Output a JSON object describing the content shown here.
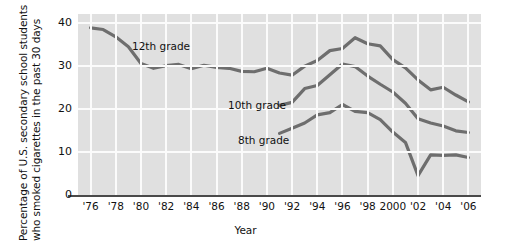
{
  "chart_data": {
    "type": "line",
    "title": "",
    "xlabel": "Year",
    "ylabel": "Percentage of U.S. secondary school students who smoked cigarettes in the past 30 days",
    "ylabel_line1": "Percentage of U.S. secondary school students",
    "ylabel_line2": "who smoked cigarettes in the past 30 days",
    "xlim": [
      1975,
      2007
    ],
    "ylim": [
      0,
      42
    ],
    "yticks": [
      0,
      10,
      20,
      30,
      40
    ],
    "ytick_labels": [
      "0",
      "10",
      "20",
      "30",
      "40"
    ],
    "xticks": [
      1976,
      1978,
      1980,
      1982,
      1984,
      1986,
      1988,
      1990,
      1992,
      1994,
      1996,
      1998,
      2000,
      2002,
      2004,
      2006
    ],
    "xtick_labels": [
      "'76",
      "'78",
      "'80",
      "'82",
      "'84",
      "'86",
      "'88",
      "'90",
      "'92",
      "'94",
      "'96",
      "'98",
      "2000",
      "'02",
      "'04",
      "'06"
    ],
    "grid": true,
    "grid_color": "#fbfbfb",
    "plot_background": "#e0e0e0",
    "line_color": "#6e6e6e",
    "legend_position": "inline-annotations",
    "series": [
      {
        "name": "12th grade",
        "label": "12th grade",
        "x": [
          1976,
          1977,
          1978,
          1979,
          1980,
          1981,
          1982,
          1983,
          1984,
          1985,
          1986,
          1987,
          1988,
          1989,
          1990,
          1991,
          1992,
          1993,
          1994,
          1995,
          1996,
          1997,
          1998,
          1999,
          2000,
          2001,
          2002,
          2003,
          2004,
          2005,
          2006
        ],
        "values": [
          38.8,
          38.4,
          36.7,
          34.4,
          30.5,
          29.4,
          30.0,
          30.3,
          29.3,
          30.1,
          29.6,
          29.4,
          28.7,
          28.6,
          29.4,
          28.3,
          27.8,
          29.9,
          31.2,
          33.5,
          34.0,
          36.5,
          35.1,
          34.6,
          31.4,
          29.5,
          26.7,
          24.4,
          25.0,
          23.2,
          21.6
        ]
      },
      {
        "name": "10th grade",
        "label": "10th grade",
        "x": [
          1991,
          1992,
          1993,
          1994,
          1995,
          1996,
          1997,
          1998,
          1999,
          2000,
          2001,
          2002,
          2003,
          2004,
          2005,
          2006
        ],
        "values": [
          20.8,
          21.5,
          24.7,
          25.4,
          27.9,
          30.4,
          29.8,
          27.6,
          25.7,
          23.9,
          21.3,
          17.7,
          16.7,
          16.0,
          14.9,
          14.5
        ]
      },
      {
        "name": "8th grade",
        "label": "8th grade",
        "x": [
          1991,
          1992,
          1993,
          1994,
          1995,
          1996,
          1997,
          1998,
          1999,
          2000,
          2001,
          2002,
          2003,
          2004,
          2005,
          2006
        ],
        "values": [
          14.3,
          15.5,
          16.7,
          18.6,
          19.1,
          21.0,
          19.4,
          19.1,
          17.5,
          14.6,
          12.2,
          4.5,
          9.3,
          9.2,
          9.3,
          8.7
        ]
      }
    ]
  }
}
